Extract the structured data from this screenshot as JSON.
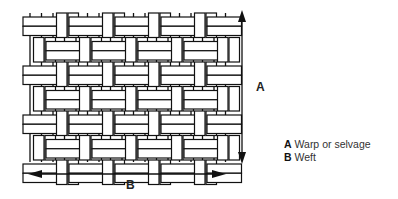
{
  "diagram": {
    "type": "basket weave fabric illustration",
    "arrow_vertical_label": "A",
    "arrow_horizontal_label": "B",
    "legend": [
      {
        "key": "A",
        "text": "Warp or selvage"
      },
      {
        "key": "B",
        "text": "Weft"
      }
    ],
    "colors": {
      "line": "#111111",
      "thread": "#ffffff"
    }
  }
}
